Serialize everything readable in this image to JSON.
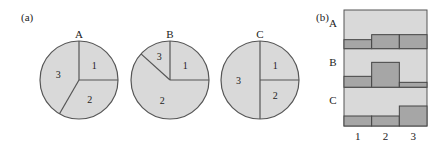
{
  "colors": {
    "fill": "#d9d9d9",
    "bar_fill": "#a6a6a6",
    "stroke": "#555555",
    "text": "#222222"
  },
  "panel_a": {
    "label": "(a)",
    "pies": [
      {
        "name": "A",
        "slices": [
          {
            "label": "1",
            "degrees": 90
          },
          {
            "label": "2",
            "degrees": 120
          },
          {
            "label": "3",
            "degrees": 150
          }
        ]
      },
      {
        "name": "B",
        "slices": [
          {
            "label": "1",
            "degrees": 90
          },
          {
            "label": "2",
            "degrees": 222
          },
          {
            "label": "3",
            "degrees": 48
          }
        ]
      },
      {
        "name": "C",
        "slices": [
          {
            "label": "1",
            "degrees": 90
          },
          {
            "label": "2",
            "degrees": 90
          },
          {
            "label": "3",
            "degrees": 180
          }
        ]
      }
    ]
  },
  "panel_b": {
    "label": "(b)",
    "rows": [
      "A",
      "B",
      "C"
    ],
    "columns": [
      "1",
      "2",
      "3"
    ]
  },
  "chart_data": [
    {
      "type": "pie",
      "title": "A",
      "categories": [
        "1",
        "2",
        "3"
      ],
      "values": [
        25,
        33,
        42
      ]
    },
    {
      "type": "pie",
      "title": "B",
      "categories": [
        "1",
        "2",
        "3"
      ],
      "values": [
        25,
        62,
        13
      ]
    },
    {
      "type": "pie",
      "title": "C",
      "categories": [
        "1",
        "2",
        "3"
      ],
      "values": [
        25,
        25,
        50
      ]
    },
    {
      "type": "bar",
      "title": "(b)",
      "categories": [
        "1",
        "2",
        "3"
      ],
      "series": [
        {
          "name": "A",
          "values": [
            9,
            14,
            14
          ]
        },
        {
          "name": "B",
          "values": [
            11,
            25,
            5
          ]
        },
        {
          "name": "C",
          "values": [
            10,
            10,
            20
          ]
        }
      ],
      "xlabel": "",
      "ylabel": "",
      "grid": false
    }
  ]
}
